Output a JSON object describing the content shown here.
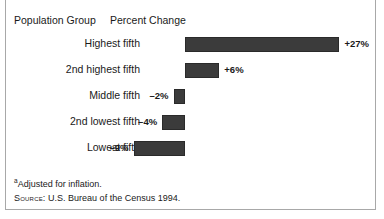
{
  "headings": {
    "population_group": "Population Group",
    "percent_change": "Percent Change"
  },
  "chart_data": {
    "type": "bar",
    "orientation": "horizontal",
    "title": "",
    "xlabel": "Percent Change",
    "ylabel": "Population Group",
    "categories": [
      "Highest fifth",
      "2nd highest fifth",
      "Middle fifth",
      "2nd lowest fifth",
      "Lowest fifth"
    ],
    "values": [
      27,
      6,
      -2,
      -4,
      -9
    ],
    "value_labels": [
      "+27%",
      "+6%",
      "–2%",
      "–4%",
      "–9%"
    ],
    "xlim": [
      -9,
      27
    ],
    "grid": false,
    "legend": null,
    "zero_axis": true,
    "bar_color": "#3b3b3b",
    "bar_outline_color": "#2a2a2a"
  },
  "footnotes": {
    "marker": "a",
    "note": "Adjusted for inflation.",
    "source_label": "Source:",
    "source_text": "U.S. Bureau of the Census 1994."
  }
}
